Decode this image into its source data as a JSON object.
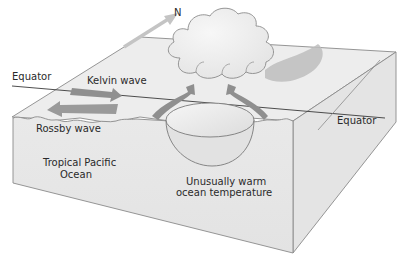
{
  "diagram": {
    "labels": {
      "north": "N",
      "equator_left": "Equator",
      "equator_right": "Equator",
      "kelvin_wave": "Kelvin wave",
      "rossby_wave": "Rossby wave",
      "ocean_line1": "Tropical Pacific",
      "ocean_line2": "Ocean",
      "warm_line1": "Unusually warm",
      "warm_line2": "ocean temperature"
    },
    "colors": {
      "box_top": "#ececec",
      "box_front": "#e6e6e6",
      "box_side": "#e2e2e2",
      "edge": "#8a8a8a",
      "arrow": "#8f8f8f",
      "north_arrow": "#c8c8c8",
      "cloud_fill": "#ededed",
      "cloud_shadow": "#bdbdbd",
      "text": "#2a2a2a"
    }
  }
}
